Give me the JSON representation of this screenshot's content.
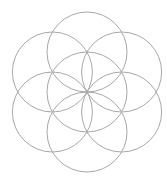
{
  "diagram": {
    "type": "geometric-pattern",
    "circle_count": 7,
    "arrangement": "one central circle with six equal circles centered on its circumference at 60-degree intervals",
    "petal_angles_deg": [
      90,
      30,
      -30,
      -90,
      -150,
      150
    ],
    "stroke_color": "#a8a8a8",
    "background_color": "#ffffff"
  }
}
